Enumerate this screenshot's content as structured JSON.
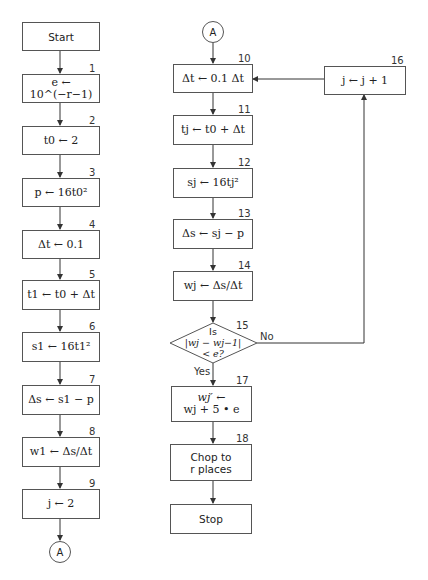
{
  "diagram": {
    "type": "flowchart",
    "left_column": {
      "start": {
        "label": "Start"
      },
      "steps": [
        {
          "num": "1",
          "text": "e ← 10^(−r−1)"
        },
        {
          "num": "2",
          "text": "t0 ← 2"
        },
        {
          "num": "3",
          "text": "p ← 16t0²"
        },
        {
          "num": "4",
          "text": "Δt ← 0.1"
        },
        {
          "num": "5",
          "text": "t1 ← t0 + Δt"
        },
        {
          "num": "6",
          "text": "s1 ← 16t1²"
        },
        {
          "num": "7",
          "text": "Δs ← s1 − p"
        },
        {
          "num": "8",
          "text": "w1 ← Δs/Δt"
        },
        {
          "num": "9",
          "text": "j ← 2"
        }
      ],
      "connector_out": "A"
    },
    "right_column": {
      "connector_in": "A",
      "steps": [
        {
          "num": "10",
          "text": "Δt ← 0.1 Δt"
        },
        {
          "num": "11",
          "text": "tj ← t0 + Δt"
        },
        {
          "num": "12",
          "text": "sj ← 16tj²"
        },
        {
          "num": "13",
          "text": "Δs ← sj − p"
        },
        {
          "num": "14",
          "text": "wj ← Δs/Δt"
        }
      ],
      "decision": {
        "num": "15",
        "line1": "Is",
        "line2": "|wj − wj−1|",
        "line3": "< e?",
        "yes_label": "Yes",
        "no_label": "No"
      },
      "after_yes": [
        {
          "num": "17",
          "line1": "wj′ ←",
          "line2": "wj + 5 • e"
        },
        {
          "num": "18",
          "line1": "Chop to",
          "line2": "r places"
        }
      ],
      "stop": {
        "label": "Stop"
      }
    },
    "loop_box": {
      "num": "16",
      "text": "j ← j + 1"
    }
  }
}
